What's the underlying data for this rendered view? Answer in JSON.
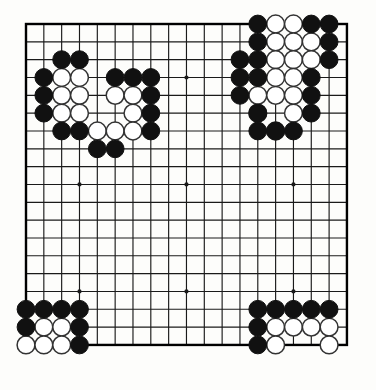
{
  "board": {
    "title": "Go board position",
    "size": 19,
    "origin_x": 26,
    "origin_y": 24,
    "spacing": 17.83,
    "line_color": "#1a1a1a",
    "border_color": "#000000",
    "background_color": "#fdfdfb",
    "black_color": "#111111",
    "white_color": "#ffffff",
    "white_outline_color": "#333333",
    "stone_radius": 8.9,
    "star_point_radius": 2.1,
    "star_points": [
      [
        3,
        3
      ],
      [
        9,
        3
      ],
      [
        15,
        3
      ],
      [
        3,
        9
      ],
      [
        9,
        9
      ],
      [
        15,
        9
      ],
      [
        3,
        15
      ],
      [
        9,
        15
      ],
      [
        15,
        15
      ]
    ],
    "column_labels": [
      "A",
      "B",
      "C",
      "D",
      "E",
      "F",
      "G",
      "H",
      "J",
      "K",
      "L",
      "M",
      "N",
      "O",
      "P",
      "Q",
      "R",
      "S",
      "T"
    ],
    "row_labels": [
      "19",
      "18",
      "17",
      "16",
      "15",
      "14",
      "13",
      "12",
      "11",
      "10",
      "9",
      "8",
      "7",
      "6",
      "5",
      "4",
      "3",
      "2",
      "1"
    ],
    "black_stones": [
      [
        13,
        0
      ],
      [
        16,
        0
      ],
      [
        17,
        0
      ],
      [
        13,
        1
      ],
      [
        17,
        1
      ],
      [
        12,
        2
      ],
      [
        13,
        2
      ],
      [
        17,
        2
      ],
      [
        2,
        2
      ],
      [
        3,
        2
      ],
      [
        1,
        3
      ],
      [
        5,
        3
      ],
      [
        6,
        3
      ],
      [
        7,
        3
      ],
      [
        12,
        3
      ],
      [
        13,
        3
      ],
      [
        16,
        3
      ],
      [
        1,
        4
      ],
      [
        7,
        4
      ],
      [
        12,
        4
      ],
      [
        16,
        4
      ],
      [
        1,
        5
      ],
      [
        7,
        5
      ],
      [
        13,
        5
      ],
      [
        16,
        5
      ],
      [
        2,
        6
      ],
      [
        3,
        6
      ],
      [
        7,
        6
      ],
      [
        13,
        6
      ],
      [
        14,
        6
      ],
      [
        15,
        6
      ],
      [
        4,
        7
      ],
      [
        5,
        7
      ],
      [
        0,
        16
      ],
      [
        1,
        16
      ],
      [
        2,
        16
      ],
      [
        3,
        16
      ],
      [
        0,
        17
      ],
      [
        3,
        17
      ],
      [
        3,
        18
      ],
      [
        13,
        16
      ],
      [
        14,
        16
      ],
      [
        15,
        16
      ],
      [
        16,
        16
      ],
      [
        17,
        16
      ],
      [
        13,
        17
      ],
      [
        13,
        18
      ]
    ],
    "white_stones": [
      [
        14,
        0
      ],
      [
        15,
        0
      ],
      [
        14,
        1
      ],
      [
        15,
        1
      ],
      [
        16,
        1
      ],
      [
        14,
        2
      ],
      [
        15,
        2
      ],
      [
        16,
        2
      ],
      [
        2,
        3
      ],
      [
        3,
        3
      ],
      [
        14,
        3
      ],
      [
        15,
        3
      ],
      [
        2,
        4
      ],
      [
        3,
        4
      ],
      [
        5,
        4
      ],
      [
        6,
        4
      ],
      [
        13,
        4
      ],
      [
        14,
        4
      ],
      [
        15,
        4
      ],
      [
        2,
        5
      ],
      [
        3,
        5
      ],
      [
        6,
        5
      ],
      [
        13,
        5
      ],
      [
        15,
        5
      ],
      [
        4,
        6
      ],
      [
        5,
        6
      ],
      [
        6,
        6
      ],
      [
        14,
        6
      ],
      [
        1,
        17
      ],
      [
        2,
        17
      ],
      [
        0,
        18
      ],
      [
        1,
        18
      ],
      [
        2,
        18
      ],
      [
        14,
        17
      ],
      [
        15,
        17
      ],
      [
        16,
        17
      ],
      [
        17,
        17
      ],
      [
        14,
        18
      ],
      [
        17,
        18
      ]
    ]
  }
}
